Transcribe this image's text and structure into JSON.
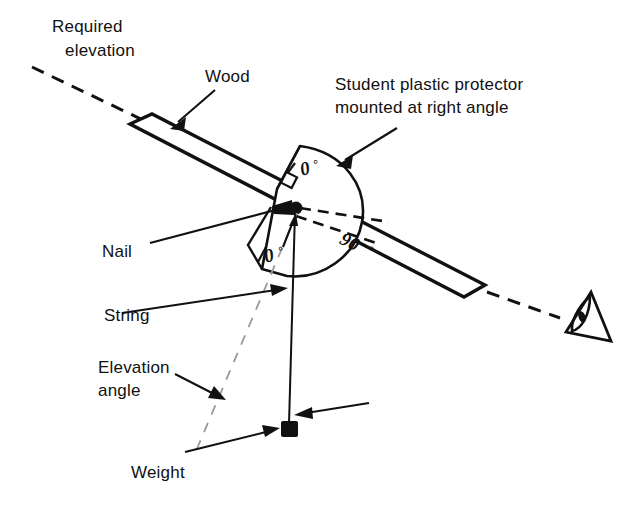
{
  "figure": {
    "background_color": "#ffffff",
    "ink_color": "#111111",
    "faint_color": "#9a9a9a",
    "width": 635,
    "height": 513
  },
  "labels": {
    "required_elevation_line1": "Required",
    "required_elevation_line2": "elevation",
    "wood": "Wood",
    "protractor_line1": "Student plastic protector",
    "protractor_line2": "mounted at right angle",
    "nail": "Nail",
    "string": "String",
    "elevation_angle_line1": "Elevation",
    "elevation_angle_line2": "angle",
    "weight": "Weight"
  },
  "scale_marks": {
    "zero_top": "0",
    "zero_top_unit": "°",
    "zero_bottom": "0",
    "zero_bottom_unit": "°",
    "ninety": "90",
    "ninety_unit": "°"
  },
  "icons": {
    "eye": "eye-icon",
    "nail_head": "nail-head-icon",
    "weight_block": "weight-block-icon",
    "mount_bracket": "mount-bracket-icon"
  }
}
